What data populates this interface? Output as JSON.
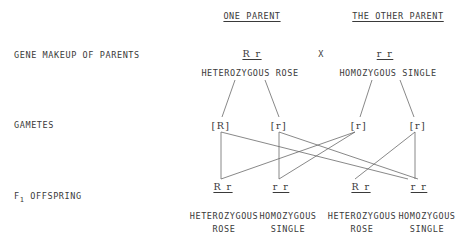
{
  "headers": {
    "one_parent": "ONE PARENT",
    "other_parent": "THE OTHER PARENT"
  },
  "rows": {
    "gene_makeup": "GENE MAKEUP OF PARENTS",
    "gametes": "GAMETES",
    "offspring_prefix": "F",
    "offspring_sub": "1",
    "offspring_suffix": " OFFSPRING"
  },
  "parents": {
    "one": {
      "genotype": "R r",
      "description": "HETEROZYGOUS ROSE"
    },
    "cross_symbol": "X",
    "other": {
      "genotype": "r r",
      "description": "HOMOZYGOUS SINGLE"
    }
  },
  "gametes": [
    "[R]",
    "[r]",
    "[r]",
    "[r]"
  ],
  "offspring": [
    {
      "genotype": "R r",
      "line1": "HETEROZYGOUS",
      "line2": "ROSE"
    },
    {
      "genotype": "r r",
      "line1": "HOMOZYGOUS",
      "line2": "SINGLE"
    },
    {
      "genotype": "R r",
      "line1": "HETEROZYGOUS",
      "line2": "ROSE"
    },
    {
      "genotype": "r r",
      "line1": "HOMOZYGOUS",
      "line2": "SINGLE"
    }
  ]
}
